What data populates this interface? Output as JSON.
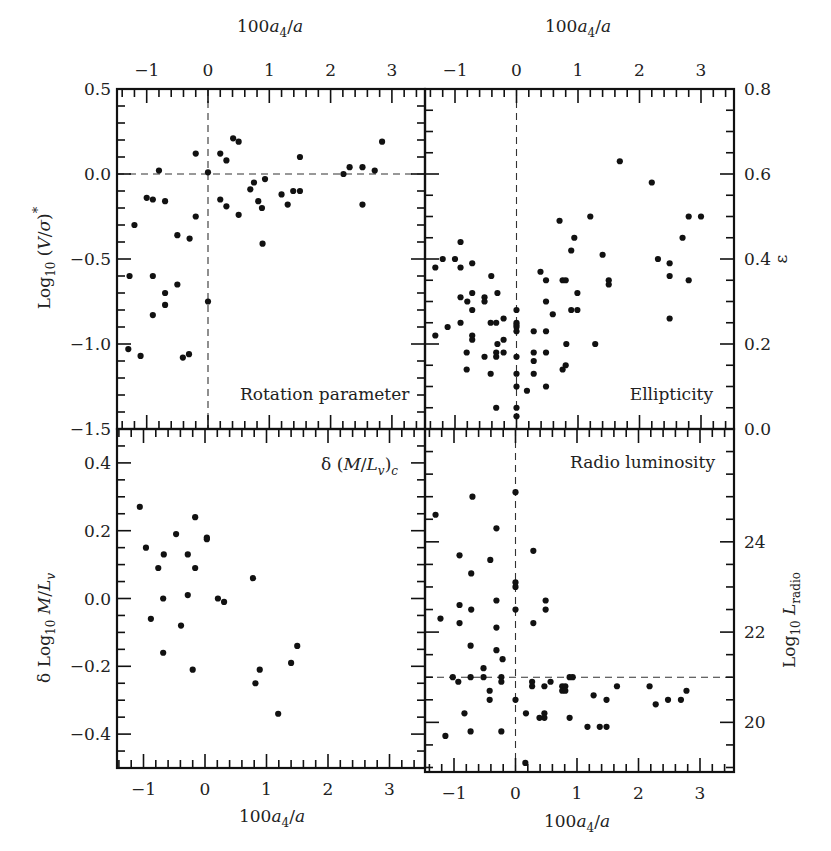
{
  "figure": {
    "top_xlabel_left": "100a4/a",
    "top_xlabel_right": "100a4/a",
    "bottom_xlabel_left": "100a4/a",
    "bottom_xlabel_right": "100a4/a"
  },
  "chart_data": [
    {
      "type": "scatter",
      "title": "Rotation parameter",
      "panel": "top-left",
      "xlabel": "100a4/a",
      "ylabel": "Log10 (V/σ)*",
      "xlim": [
        -1.48,
        3.55
      ],
      "ylim": [
        -1.5,
        0.5
      ],
      "xticks": [
        -1,
        0,
        1,
        2,
        3
      ],
      "yticks": [
        -1.5,
        -1.0,
        -0.5,
        0.0,
        0.5
      ],
      "ytick_labels": [
        "−1.5",
        "−1.0",
        "−0.5",
        "0.0",
        "0.5"
      ],
      "reference_lines": {
        "x": 0,
        "y": 0.0
      },
      "x": [
        -0.8,
        -0.2,
        0.0,
        0.2,
        0.3,
        0.41,
        0.5,
        1.5,
        2.84,
        2.21,
        2.31,
        2.52,
        2.72,
        0.69,
        0.75,
        0.93,
        1.2,
        1.39,
        1.5,
        1.3,
        2.52,
        -1.0,
        -0.9,
        -0.7,
        0.2,
        0.3,
        0.82,
        0.88,
        -0.2,
        0.5,
        -1.2,
        -0.5,
        -0.3,
        0.89,
        -1.28,
        -0.9,
        -0.7,
        -0.5,
        -0.7,
        -0.9,
        0.0,
        -1.3,
        -1.1,
        -0.41,
        -0.31
      ],
      "y": [
        0.02,
        0.12,
        0.01,
        0.12,
        0.08,
        0.21,
        0.19,
        0.1,
        0.19,
        0.0,
        0.04,
        0.04,
        0.02,
        -0.09,
        -0.05,
        -0.03,
        -0.12,
        -0.1,
        -0.1,
        -0.18,
        -0.18,
        -0.14,
        -0.15,
        -0.16,
        -0.15,
        -0.19,
        -0.16,
        -0.2,
        -0.25,
        -0.24,
        -0.3,
        -0.36,
        -0.38,
        -0.41,
        -0.6,
        -0.6,
        -0.7,
        -0.65,
        -0.77,
        -0.83,
        -0.75,
        -1.03,
        -1.07,
        -1.08,
        -1.06
      ]
    },
    {
      "type": "scatter",
      "title": "Ellipticity",
      "panel": "top-right",
      "xlabel": "100a4/a",
      "ylabel": "ε",
      "xlim": [
        -1.48,
        3.53
      ],
      "ylim": [
        0.0,
        0.8
      ],
      "xticks": [
        -1,
        0,
        1,
        2,
        3
      ],
      "yticks": [
        0.0,
        0.2,
        0.4,
        0.6,
        0.8
      ],
      "ytick_labels": [
        "0.0",
        "0.2",
        "0.4",
        "0.6",
        "0.8"
      ],
      "reference_lines": {
        "x": 0
      },
      "x": [
        -1.32,
        -1.2,
        -1.0,
        -0.91,
        -0.91,
        -0.72,
        -0.41,
        -0.91,
        -0.8,
        -0.72,
        -0.52,
        -0.52,
        -0.31,
        -0.72,
        -0.91,
        -1.12,
        -1.32,
        -0.42,
        -0.33,
        -0.21,
        -0.72,
        -0.72,
        -0.31,
        -0.21,
        -0.81,
        -0.52,
        -0.33,
        -0.33,
        -0.21,
        -0.81,
        -0.42,
        -0.33,
        0.0,
        0.0,
        0.0,
        0.0,
        0.0,
        0.0,
        0.0,
        0.0,
        0.0,
        0.0,
        0.17,
        0.28,
        0.28,
        0.28,
        0.28,
        0.39,
        0.48,
        0.48,
        0.48,
        0.48,
        0.48,
        0.59,
        0.7,
        0.75,
        0.8,
        0.81,
        0.75,
        0.8,
        0.89,
        0.94,
        0.89,
        0.99,
        0.99,
        1.2,
        1.4,
        1.28,
        1.5,
        1.5,
        1.68,
        2.2,
        2.8,
        3.0,
        2.7,
        2.3,
        2.49,
        2.49,
        2.8,
        2.49
      ],
      "y": [
        0.38,
        0.4,
        0.4,
        0.44,
        0.38,
        0.39,
        0.36,
        0.31,
        0.3,
        0.32,
        0.31,
        0.3,
        0.32,
        0.28,
        0.25,
        0.24,
        0.22,
        0.25,
        0.25,
        0.26,
        0.22,
        0.21,
        0.2,
        0.21,
        0.18,
        0.17,
        0.18,
        0.17,
        0.18,
        0.14,
        0.13,
        0.05,
        0.28,
        0.25,
        0.245,
        0.24,
        0.23,
        0.17,
        0.13,
        0.1,
        0.05,
        0.03,
        0.09,
        0.23,
        0.18,
        0.16,
        0.13,
        0.37,
        0.35,
        0.3,
        0.23,
        0.18,
        0.1,
        0.27,
        0.49,
        0.35,
        0.35,
        0.2,
        0.14,
        0.15,
        0.42,
        0.45,
        0.28,
        0.28,
        0.32,
        0.5,
        0.41,
        0.2,
        0.35,
        0.34,
        0.63,
        0.58,
        0.5,
        0.5,
        0.45,
        0.4,
        0.39,
        0.36,
        0.35,
        0.26
      ]
    },
    {
      "type": "scatter",
      "title": "δ (M/Lv)c",
      "panel": "bottom-left",
      "xlabel": "100a4/a",
      "ylabel": "δ Log10 M/Lv",
      "xlim": [
        -1.43,
        3.58
      ],
      "ylim": [
        -0.5,
        0.5
      ],
      "xticks": [
        -1,
        0,
        1,
        2,
        3
      ],
      "yticks": [
        -0.4,
        -0.2,
        0.0,
        0.2,
        0.4
      ],
      "ytick_labels": [
        "−0.4",
        "−0.2",
        "0.0",
        "0.2",
        "0.4"
      ],
      "x": [
        -1.06,
        -0.16,
        -0.47,
        0.03,
        0.03,
        -0.96,
        -0.67,
        -0.28,
        -0.76,
        -0.16,
        0.78,
        -0.68,
        -0.28,
        0.21,
        0.31,
        -0.88,
        -0.39,
        -0.68,
        -0.2,
        0.89,
        0.82,
        1.4,
        1.5,
        1.19
      ],
      "y": [
        0.27,
        0.24,
        0.19,
        0.18,
        0.175,
        0.15,
        0.13,
        0.13,
        0.09,
        0.09,
        0.06,
        0.0,
        0.01,
        0.0,
        -0.01,
        -0.06,
        -0.08,
        -0.16,
        -0.21,
        -0.21,
        -0.25,
        -0.19,
        -0.14,
        -0.34
      ]
    },
    {
      "type": "scatter",
      "title": "Radio luminosity",
      "panel": "bottom-right",
      "xlabel": "100a4/a",
      "ylabel": "Log10 Lradio",
      "xlim": [
        -1.48,
        3.53
      ],
      "ylim": [
        18.9,
        26.5
      ],
      "xticks": [
        -1,
        0,
        1,
        2,
        3
      ],
      "yticks": [
        20,
        22,
        24
      ],
      "ytick_labels": [
        "20",
        "22",
        "24"
      ],
      "reference_lines": {
        "x": 0,
        "y": 21.0
      },
      "x": [
        -0.7,
        0.0,
        -1.3,
        -0.31,
        -0.91,
        -0.41,
        0.29,
        -0.72,
        0.0,
        0.0,
        -0.91,
        -0.31,
        -0.72,
        0.0,
        0.49,
        0.49,
        -1.22,
        -0.91,
        -0.31,
        0.29,
        -0.73,
        -0.31,
        -0.21,
        -0.52,
        -1.02,
        -0.93,
        -0.73,
        -0.52,
        -0.23,
        -0.23,
        -0.42,
        -0.42,
        0.0,
        -0.83,
        -1.14,
        -0.73,
        -0.23,
        0.17,
        0.27,
        0.27,
        0.47,
        0.57,
        0.76,
        0.76,
        0.81,
        0.81,
        0.88,
        0.93,
        0.39,
        0.47,
        0.47,
        0.88,
        1.27,
        1.48,
        1.17,
        1.37,
        1.48,
        1.65,
        2.18,
        2.28,
        2.48,
        2.69,
        2.78,
        0.16
      ],
      "y": [
        25.0,
        25.1,
        24.6,
        24.3,
        23.7,
        23.6,
        23.8,
        23.3,
        23.1,
        23.0,
        22.6,
        22.7,
        22.5,
        22.5,
        22.7,
        22.5,
        22.3,
        22.2,
        22.1,
        22.2,
        21.7,
        21.6,
        21.4,
        21.2,
        21.0,
        20.9,
        21.0,
        21.0,
        21.0,
        20.9,
        20.7,
        20.5,
        20.5,
        20.2,
        19.7,
        19.8,
        19.8,
        20.2,
        20.9,
        20.8,
        20.8,
        20.9,
        20.8,
        20.7,
        20.8,
        20.7,
        21.0,
        21.0,
        20.1,
        20.2,
        20.1,
        20.1,
        20.6,
        20.5,
        19.9,
        19.9,
        19.9,
        20.8,
        20.8,
        20.4,
        20.5,
        20.5,
        20.7,
        19.1
      ]
    }
  ]
}
